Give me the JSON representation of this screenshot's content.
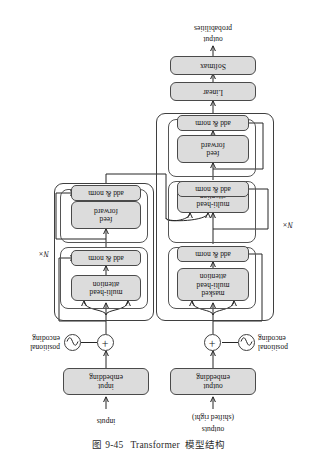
{
  "figure": {
    "caption_number": "图 9-45",
    "caption_title": "Transformer",
    "caption_tail": "模型结构",
    "orientation_degrees": 180,
    "diagram_type": "transformer-architecture"
  },
  "encoder": {
    "input_label": "inputs",
    "embedding_label": "input\nembedding",
    "positional_encoding_label": "positional\nencoding",
    "add_symbol": "+",
    "sine_symbol": "~",
    "repeat_label": "N×",
    "blocks": [
      {
        "name": "multi-head attention",
        "label": "multi-head\nattention"
      },
      {
        "name": "add-and-norm-1",
        "label": "add & norm"
      },
      {
        "name": "feed forward",
        "label": "feed\nforward"
      },
      {
        "name": "add-and-norm-2",
        "label": "add & norm"
      }
    ]
  },
  "decoder": {
    "input_label_line1": "outputs",
    "input_label_line2": "(shifted right)",
    "embedding_label": "output\nembedding",
    "positional_encoding_label": "positional\nencoding",
    "add_symbol": "+",
    "sine_symbol": "~",
    "repeat_label": "N×",
    "blocks": [
      {
        "name": "masked multi-head attention",
        "label": "masked\nmulti-head\nattention"
      },
      {
        "name": "add-and-norm-1",
        "label": "add & norm"
      },
      {
        "name": "cross multi-head attention",
        "label": "multi-head\nattention"
      },
      {
        "name": "add-and-norm-2",
        "label": "add & norm"
      },
      {
        "name": "feed forward",
        "label": "feed\nforward"
      },
      {
        "name": "add-and-norm-3",
        "label": "add & norm"
      }
    ],
    "head": [
      {
        "name": "linear",
        "label": "Linear"
      },
      {
        "name": "softmax",
        "label": "Softmax"
      }
    ],
    "output_label_line1": "output",
    "output_label_line2": "probabilities"
  },
  "colors": {
    "node_fill": "#dcdcdc",
    "node_stroke": "#4a4a4a",
    "wire": "#262626",
    "page_bg": "#ffffff"
  }
}
